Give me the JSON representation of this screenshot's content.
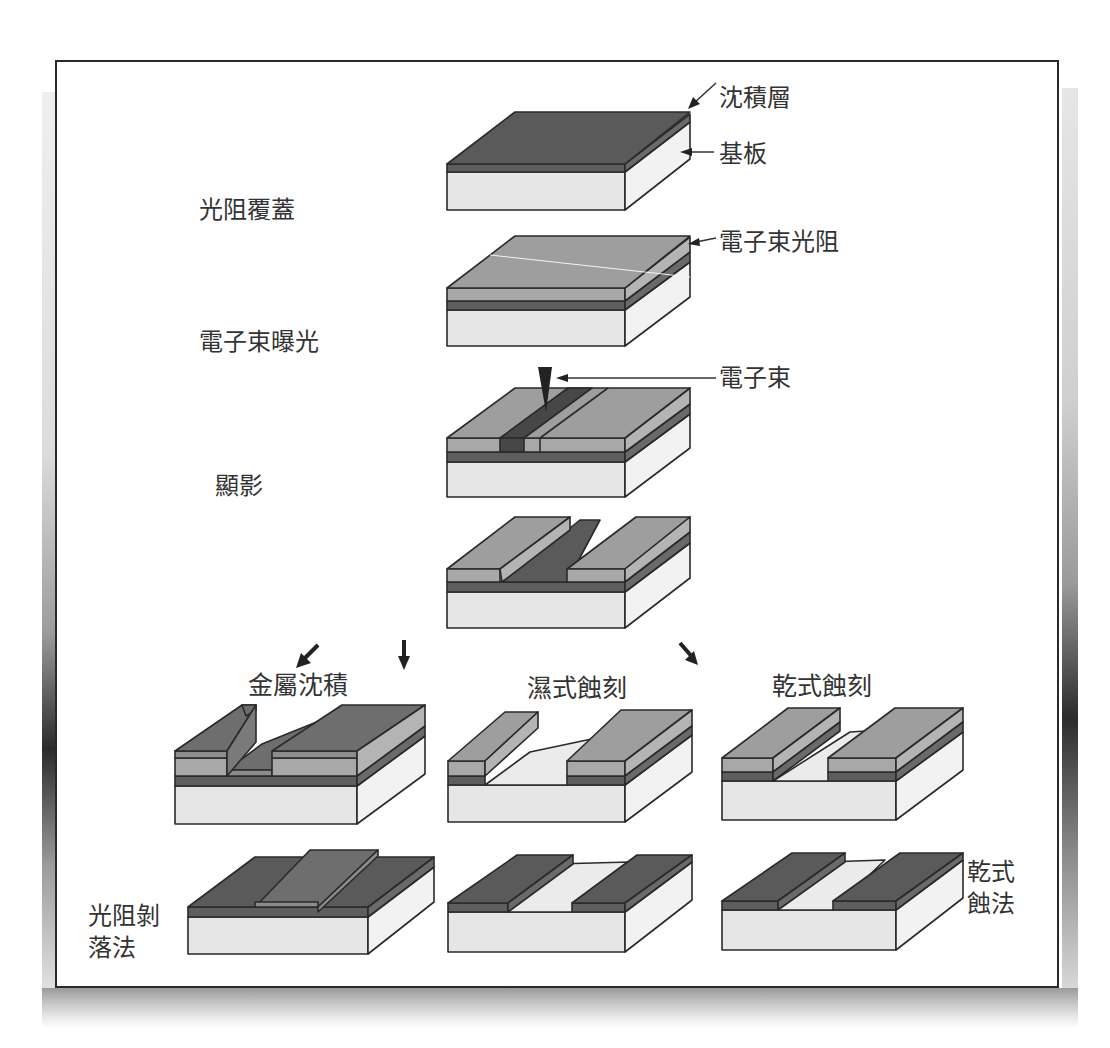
{
  "diagram": {
    "colors": {
      "substrate_front": "#e6e6e6",
      "substrate_side": "#f1f1f1",
      "deposit_layer": "#5c5c5c",
      "deposit_top": "#5a5a5a",
      "resist_front": "#a6a6a6",
      "resist_top": "#9c9c9c",
      "exposed_resist": "#4a4a4a",
      "outline": "#2a2a2a",
      "frame_border": "#2a2a2a"
    },
    "layer_labels": {
      "deposition_layer": "沈積層",
      "substrate": "基板",
      "ebeam_resist": "電子束光阻",
      "ebeam": "電子束"
    },
    "step_labels": {
      "resist_coating": "光阻覆蓋",
      "ebeam_exposure": "電子束曝光",
      "development": "顯影"
    },
    "branch_labels": {
      "metal_deposition": "金屬沈積",
      "wet_etching": "濕式蝕刻",
      "dry_etching": "乾式蝕刻"
    },
    "result_labels": {
      "lift_off": "光阻剝落法",
      "lift_off_line1": "光阻剝",
      "lift_off_line2": "落法",
      "dry_etch_method_line1": "乾式",
      "dry_etch_method_line2": "蝕法"
    },
    "icons": {
      "ebeam": "ebeam-cone-icon",
      "arrows": [
        "arrow-down-left-icon",
        "arrow-down-icon",
        "arrow-down-right-icon"
      ]
    }
  }
}
